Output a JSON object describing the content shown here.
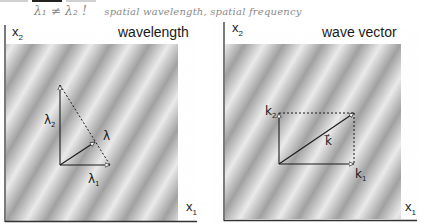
{
  "annotation": {
    "formula": "λ₁ ≠ λ₂ !",
    "note": "spatial wavelength, spatial frequency"
  },
  "panels": [
    {
      "id": "left",
      "title": "wavelength",
      "x_axis_label": "x",
      "x_axis_sub": "1",
      "y_axis_label": "x",
      "y_axis_sub": "2",
      "vectors": [
        {
          "name": "λ",
          "sub": "1",
          "label": "λ₁",
          "from": [
            60,
            165
          ],
          "to": [
            110,
            165
          ],
          "style": "solid"
        },
        {
          "name": "λ",
          "sub": "2",
          "label": "λ₂",
          "from": [
            60,
            165
          ],
          "to": [
            60,
            85
          ],
          "style": "solid"
        },
        {
          "name": "λ",
          "sub": "",
          "label": "λ",
          "from": [
            60,
            165
          ],
          "to": [
            95,
            142
          ],
          "style": "solid"
        },
        {
          "name": "hyp",
          "label": "",
          "from": [
            60,
            85
          ],
          "to": [
            110,
            165
          ],
          "style": "dashed"
        }
      ]
    },
    {
      "id": "right",
      "title": "wave vector",
      "x_axis_label": "x",
      "x_axis_sub": "1",
      "y_axis_label": "x",
      "y_axis_sub": "2",
      "vectors": [
        {
          "name": "k",
          "sub": "1",
          "label": "k₁",
          "from": [
            279,
            164
          ],
          "to": [
            354,
            164
          ],
          "style": "solid"
        },
        {
          "name": "k",
          "sub": "2",
          "label": "k₂",
          "from": [
            279,
            164
          ],
          "to": [
            279,
            113
          ],
          "style": "solid"
        },
        {
          "name": "k",
          "sub": "",
          "label": "k⃗",
          "from": [
            279,
            164
          ],
          "to": [
            354,
            113
          ],
          "style": "solid"
        },
        {
          "name": "top",
          "label": "",
          "from": [
            279,
            113
          ],
          "to": [
            354,
            113
          ],
          "style": "dashed"
        },
        {
          "name": "right",
          "label": "",
          "from": [
            354,
            113
          ],
          "to": [
            354,
            164
          ],
          "style": "dashed"
        }
      ]
    }
  ],
  "labels": {
    "lambda": "λ",
    "k": "k",
    "sub1": "1",
    "sub2": "2",
    "kvec": "k⃗"
  },
  "colors": {
    "ink": "#1a1a1a",
    "pencil": "#8a8a8a",
    "grating_light": "#f2f2f2",
    "grating_dark": "#9a9a9a"
  }
}
